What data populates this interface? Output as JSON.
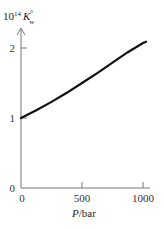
{
  "chart_data": {
    "type": "line",
    "title": "",
    "ylabel_parts": {
      "prefix": "10",
      "exp": "14",
      "symbol": "K",
      "sup": "°",
      "sub": "w"
    },
    "ylabel": "10^14 K°_w",
    "xlabel": "P/bar",
    "xlabel_italic": "P",
    "xlabel_rest": "/bar",
    "x_ticks": [
      0,
      500,
      1000
    ],
    "x_tick_labels": [
      "0",
      "500",
      "1000"
    ],
    "y_ticks": [
      0,
      1,
      2
    ],
    "y_tick_labels": [
      "0",
      "1",
      "2"
    ],
    "xlim": [
      0,
      1030
    ],
    "ylim": [
      0,
      2.2
    ],
    "grid": false,
    "legend": null,
    "series": [
      {
        "name": "10^14 K°w vs P",
        "x": [
          0,
          125,
          250,
          375,
          500,
          625,
          750,
          875,
          1000,
          1025
        ],
        "y": [
          1.0,
          1.11,
          1.23,
          1.36,
          1.5,
          1.64,
          1.79,
          1.94,
          2.07,
          2.09
        ]
      }
    ],
    "colors": {
      "curve": "#111111",
      "axes": "#777777"
    }
  }
}
